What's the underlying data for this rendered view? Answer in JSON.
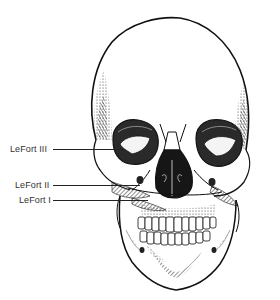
{
  "diagram": {
    "background": "#ffffff",
    "ink_color": "#1a1a1a",
    "labels": [
      {
        "text": "LeFort III",
        "x": 10,
        "y": 144,
        "line_from_x": 53,
        "line_to_x": 125,
        "line_y": 149
      },
      {
        "text": "LeFort II",
        "x": 15,
        "y": 180,
        "line_from_x": 53,
        "line_to_x": 140,
        "line_y": 185
      },
      {
        "text": "LeFort I",
        "x": 19,
        "y": 195,
        "line_from_x": 53,
        "line_to_x": 148,
        "line_y": 200
      }
    ]
  }
}
